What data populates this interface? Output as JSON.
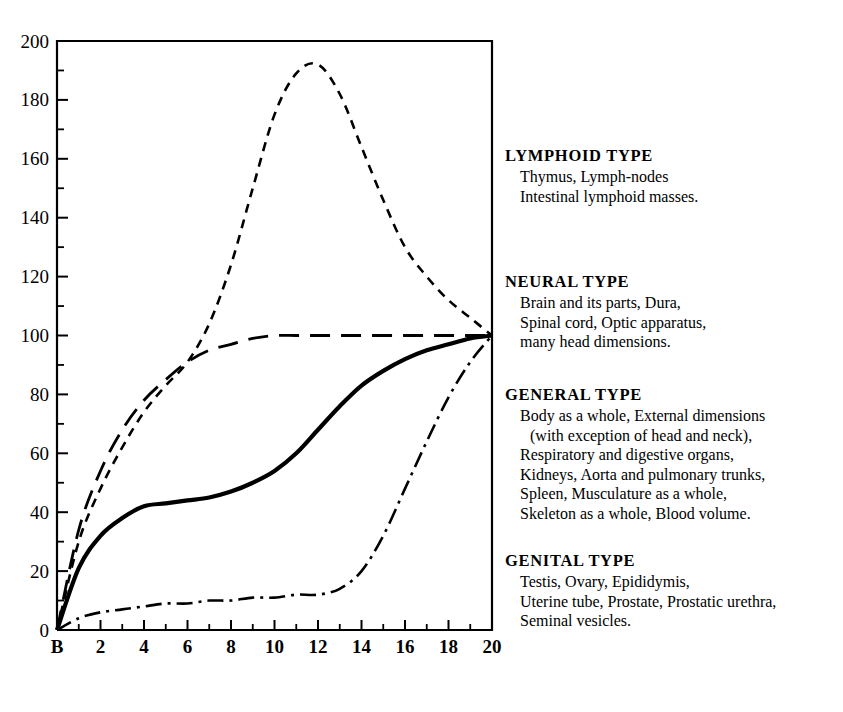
{
  "figure": {
    "percent_symbol": "%",
    "x_axis_title": "AGE IN YEARS"
  },
  "legend": {
    "blocks": [
      {
        "title": "LYMPHOID TYPE",
        "lines": [
          "Thymus, Lymph-nodes",
          "Intestinal lymphoid masses."
        ]
      },
      {
        "title": "NEURAL TYPE",
        "lines": [
          "Brain and its parts, Dura,",
          "Spinal cord, Optic apparatus,",
          "many head dimensions."
        ]
      },
      {
        "title": "GENERAL TYPE",
        "lines": [
          "Body as a whole, External dimensions",
          "(with exception of head and neck),",
          "Respiratory and digestive organs,",
          "Kidneys, Aorta and pulmonary trunks,",
          "Spleen, Musculature as a whole,",
          "Skeleton as a whole, Blood volume."
        ]
      },
      {
        "title": "GENITAL TYPE",
        "lines": [
          "Testis, Ovary, Epididymis,",
          "Uterine tube, Prostate, Prostatic urethra,",
          "Seminal vesicles."
        ]
      }
    ]
  },
  "chart_data": {
    "type": "line",
    "title": "",
    "xlabel": "AGE IN YEARS",
    "ylabel": "%",
    "xlim": [
      0,
      20
    ],
    "ylim": [
      0,
      200
    ],
    "grid": false,
    "legend_position": "right",
    "x_tick_labels": [
      "B",
      "2",
      "4",
      "6",
      "8",
      "10",
      "12",
      "14",
      "16",
      "18",
      "20"
    ],
    "x_major_ticks": [
      0,
      2,
      4,
      6,
      8,
      10,
      12,
      14,
      16,
      18,
      20
    ],
    "x_minor_ticks": [
      1,
      3,
      5,
      7,
      9,
      11,
      13,
      15,
      17,
      19
    ],
    "y_tick_labels": [
      "0",
      "20",
      "40",
      "60",
      "80",
      "100",
      "120",
      "140",
      "160",
      "180",
      "200"
    ],
    "y_major_ticks": [
      0,
      20,
      40,
      60,
      80,
      100,
      120,
      140,
      160,
      180,
      200
    ],
    "y_minor_ticks": [
      10,
      30,
      50,
      70,
      90,
      110,
      130,
      150,
      170,
      190
    ],
    "x": [
      0,
      1,
      2,
      3,
      4,
      5,
      6,
      7,
      8,
      9,
      10,
      11,
      12,
      13,
      14,
      15,
      16,
      17,
      18,
      19,
      20
    ],
    "series": [
      {
        "name": "Lymphoid type",
        "style": "dashed",
        "values": [
          0,
          30,
          48,
          62,
          74,
          83,
          91,
          104,
          124,
          150,
          175,
          189,
          192,
          182,
          164,
          146,
          130,
          120,
          112,
          106,
          100
        ]
      },
      {
        "name": "Neural type",
        "style": "long-dashed",
        "values": [
          0,
          34,
          54,
          68,
          78,
          85,
          91,
          95,
          97,
          99,
          100,
          100,
          100,
          100,
          100,
          100,
          100,
          100,
          100,
          100,
          100
        ]
      },
      {
        "name": "General type",
        "style": "solid",
        "values": [
          0,
          21,
          32,
          38,
          42,
          43,
          44,
          45,
          47,
          50,
          54,
          60,
          68,
          76,
          83,
          88,
          92,
          95,
          97,
          99,
          100
        ]
      },
      {
        "name": "Genital type",
        "style": "dash-dot",
        "values": [
          0,
          4,
          6,
          7,
          8,
          9,
          9,
          10,
          10,
          11,
          11,
          12,
          12,
          14,
          20,
          32,
          48,
          64,
          79,
          91,
          100
        ]
      }
    ]
  }
}
